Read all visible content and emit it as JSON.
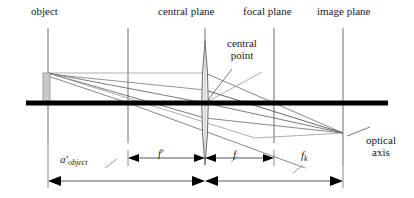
{
  "figure": {
    "type": "optical-ray-diagram",
    "background_color": "#ffffff",
    "stroke_color": "#3a3a3a",
    "axis_color": "#000000",
    "object_fill": "#c9c9c9",
    "object_stroke": "#8a8a8a"
  },
  "labels": {
    "object": "object",
    "central_plane": "central plane",
    "focal_plane": "focal plane",
    "image_plane": "image plane",
    "central_point_line1": "central",
    "central_point_line2": "point",
    "optical_axis_line1": "optical",
    "optical_axis_line2": "axis"
  },
  "dimensions": {
    "a_object": {
      "symbol": "a",
      "prime": "′",
      "subscript": "object"
    },
    "f_prime": {
      "symbol": "f",
      "prime": "′",
      "subscript": ""
    },
    "f": {
      "symbol": "f",
      "prime": "",
      "subscript": ""
    },
    "f_k": {
      "symbol": "f",
      "prime": "",
      "subscript": "k"
    }
  },
  "geometry": {
    "planes": [
      {
        "name": "object-plane",
        "x": 48,
        "y1": 28,
        "y2": 143,
        "labeled": true
      },
      {
        "name": "front-focal-plane",
        "x": 128,
        "y1": 28,
        "y2": 143,
        "labeled": false
      },
      {
        "name": "central-plane",
        "x": 205,
        "y1": 28,
        "y2": 143,
        "labeled": true
      },
      {
        "name": "focal-plane",
        "x": 274,
        "y1": 28,
        "y2": 143,
        "labeled": true
      },
      {
        "name": "image-plane",
        "x": 343,
        "y1": 28,
        "y2": 166,
        "labeled": true
      }
    ],
    "optical_axis": {
      "x1": 26,
      "y": 103,
      "x2": 388,
      "thickness": 5
    },
    "object_rect": {
      "x": 43,
      "y": 73,
      "width": 7,
      "height": 30
    },
    "lens": {
      "cx": 205,
      "cy": 103,
      "ry": 62,
      "rx": 5
    },
    "image_point": {
      "x": 343,
      "y": 133
    }
  }
}
